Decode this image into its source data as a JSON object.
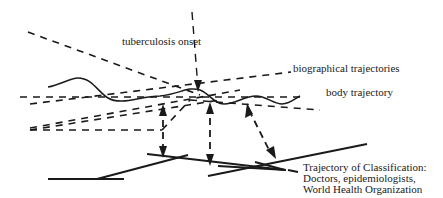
{
  "labels": {
    "tuberculosis_onset": "tuberculosis onset",
    "biographical_trajectories": "biographical trajectories",
    "body_trajectory": "body trajectory",
    "classification": [
      "Trajectory of Classification:",
      "Doctors, epidemiologists,",
      "World Health Organization"
    ]
  },
  "colors": {
    "ink": "#1a1a1a",
    "background": "#ffffff"
  }
}
